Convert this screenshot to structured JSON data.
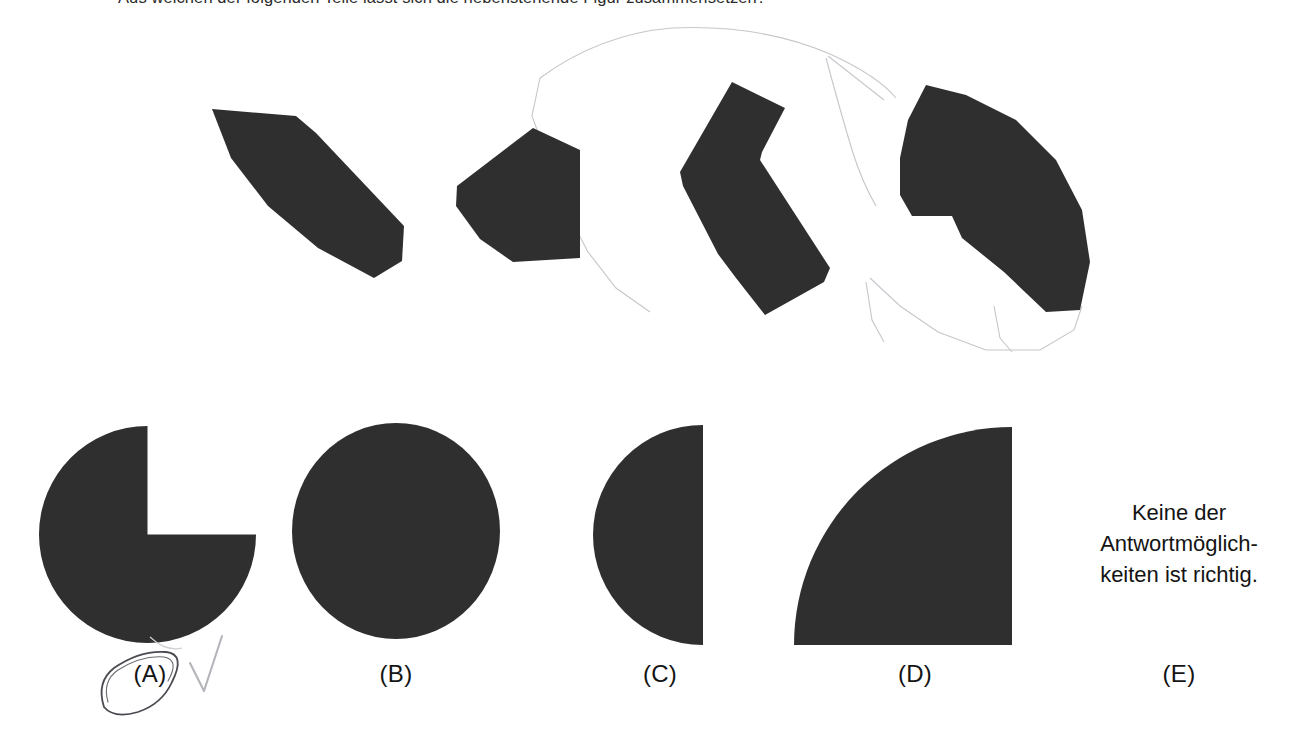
{
  "question": {
    "stem": "Aus welchen der folgenden Teile lässt sich die nebenstehende Figur zusammensetzen?",
    "fill_color": "#2f2f2f",
    "pencil_color": "#b9b9be",
    "ink_color": "#4a4a52"
  },
  "fragments": {
    "caption": "vier schwarze Puzzleteile mit Bleistift-Hilfslinien",
    "pieces": [
      {
        "id": "fragment-1",
        "shape": "lens-petal",
        "bbox": [
          210,
          85,
          200,
          195
        ]
      },
      {
        "id": "fragment-2",
        "shape": "sector-trapezoid",
        "bbox": [
          455,
          108,
          125,
          135
        ]
      },
      {
        "id": "fragment-3",
        "shape": "chevron-arrow",
        "bbox": [
          680,
          62,
          150,
          235
        ]
      },
      {
        "id": "fragment-4",
        "shape": "notched-sector",
        "bbox": [
          900,
          65,
          190,
          225
        ]
      }
    ]
  },
  "options": [
    {
      "key": "A",
      "label": "(A)",
      "shape": "pacman-three-quarter-circle",
      "marked": true,
      "mark": "circled",
      "check": true
    },
    {
      "key": "B",
      "label": "(B)",
      "shape": "full-circle",
      "marked": false,
      "mark": "",
      "check": false
    },
    {
      "key": "C",
      "label": "(C)",
      "shape": "left-half-circle",
      "marked": false,
      "mark": "",
      "check": false
    },
    {
      "key": "D",
      "label": "(D)",
      "shape": "quarter-circle",
      "marked": false,
      "mark": "",
      "check": false
    },
    {
      "key": "E",
      "label": "(E)",
      "shape": "text-only",
      "marked": false,
      "mark": "",
      "check": false
    }
  ],
  "option_e": {
    "line1": "Keine der",
    "line2": "Antwortmöglich-",
    "line3": "keiten ist richtig."
  }
}
